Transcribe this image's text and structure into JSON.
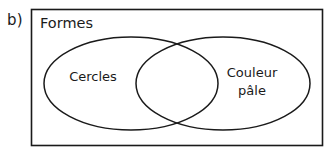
{
  "figure": {
    "item_label": "b)",
    "universe": {
      "title": "Formes",
      "shape": "rectangle"
    },
    "sets": [
      {
        "label": "Cercles",
        "shape": "ellipse",
        "position": "left"
      },
      {
        "label_line_1": "Couleur",
        "label_line_2": "pâle",
        "shape": "ellipse",
        "position": "right"
      }
    ],
    "intersection": {
      "label": ""
    },
    "colors": {
      "stroke": "#1a1a1a",
      "background": "#ffffff",
      "text": "#1a1a1a"
    }
  }
}
